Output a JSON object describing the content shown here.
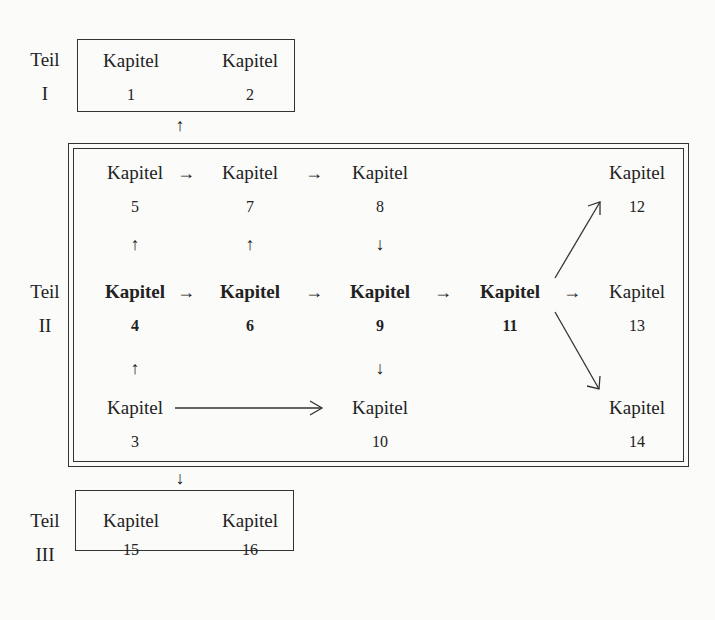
{
  "parts": [
    {
      "label": "Teil",
      "numeral": "I"
    },
    {
      "label": "Teil",
      "numeral": "II"
    },
    {
      "label": "Teil",
      "numeral": "III"
    }
  ],
  "chapters": {
    "c1": {
      "label": "Kapitel",
      "num": "1"
    },
    "c2": {
      "label": "Kapitel",
      "num": "2"
    },
    "c3": {
      "label": "Kapitel",
      "num": "3"
    },
    "c4": {
      "label": "Kapitel",
      "num": "4"
    },
    "c5": {
      "label": "Kapitel",
      "num": "5"
    },
    "c6": {
      "label": "Kapitel",
      "num": "6"
    },
    "c7": {
      "label": "Kapitel",
      "num": "7"
    },
    "c8": {
      "label": "Kapitel",
      "num": "8"
    },
    "c9": {
      "label": "Kapitel",
      "num": "9"
    },
    "c10": {
      "label": "Kapitel",
      "num": "10"
    },
    "c11": {
      "label": "Kapitel",
      "num": "11"
    },
    "c12": {
      "label": "Kapitel",
      "num": "12"
    },
    "c13": {
      "label": "Kapitel",
      "num": "13"
    },
    "c14": {
      "label": "Kapitel",
      "num": "14"
    },
    "c15": {
      "label": "Kapitel",
      "num": "15"
    },
    "c16": {
      "label": "Kapitel",
      "num": "16"
    }
  },
  "bold_chapters": [
    "4",
    "6",
    "9",
    "11"
  ],
  "arrows": {
    "right": "→",
    "up": "↑",
    "down": "↓"
  },
  "edges": [
    {
      "from": "Teil II",
      "to": "Teil I"
    },
    {
      "from": "Teil II",
      "to": "Teil III"
    },
    {
      "from": "5",
      "to": "7"
    },
    {
      "from": "7",
      "to": "8"
    },
    {
      "from": "4",
      "to": "5"
    },
    {
      "from": "6",
      "to": "7"
    },
    {
      "from": "8",
      "to": "9"
    },
    {
      "from": "4",
      "to": "6"
    },
    {
      "from": "6",
      "to": "9"
    },
    {
      "from": "9",
      "to": "11"
    },
    {
      "from": "11",
      "to": "12"
    },
    {
      "from": "11",
      "to": "13"
    },
    {
      "from": "11",
      "to": "14"
    },
    {
      "from": "3",
      "to": "4"
    },
    {
      "from": "9",
      "to": "10"
    },
    {
      "from": "3",
      "to": "10"
    }
  ]
}
